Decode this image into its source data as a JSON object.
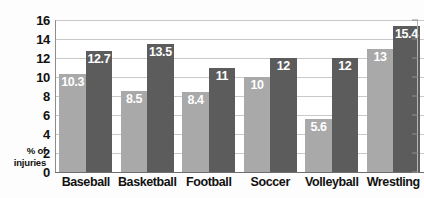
{
  "chart_data": {
    "type": "bar",
    "title": "",
    "xlabel": "",
    "ylabel": "% of injuries",
    "ylim": [
      0,
      16
    ],
    "yticks": [
      0,
      2,
      4,
      6,
      8,
      10,
      12,
      14,
      16
    ],
    "ytick_labels": [
      "0",
      "2",
      "4",
      "6",
      "8",
      "10",
      "12",
      "14",
      "16"
    ],
    "grid": true,
    "legend": "none",
    "categories": [
      "Baseball",
      "Basketball",
      "Football",
      "Soccer",
      "Volleyball",
      "Wrestling"
    ],
    "series": [
      {
        "name": "series-a",
        "color": "#a9a9a9",
        "values": [
          10.3,
          8.5,
          8.4,
          10,
          5.6,
          13
        ],
        "labels": [
          "10.3",
          "8.5",
          "8.4",
          "10",
          "5.6",
          "13"
        ]
      },
      {
        "name": "series-b",
        "color": "#5c5c5c",
        "values": [
          12.7,
          13.5,
          11,
          12,
          12,
          15.4
        ],
        "labels": [
          "12.7",
          "13.5",
          "11",
          "12",
          "12",
          "15.4"
        ]
      }
    ]
  },
  "axis": {
    "y_title_line1": "% of",
    "y_title_line2": "injuries"
  },
  "colors": {
    "series_a": "#a9a9a9",
    "series_b": "#5c5c5c",
    "gridline": "#c9c9c9",
    "axis": "#6f6f6f",
    "label_text": "#111111",
    "bar_label_text": "#ffffff",
    "background": "#fdfdfd"
  }
}
